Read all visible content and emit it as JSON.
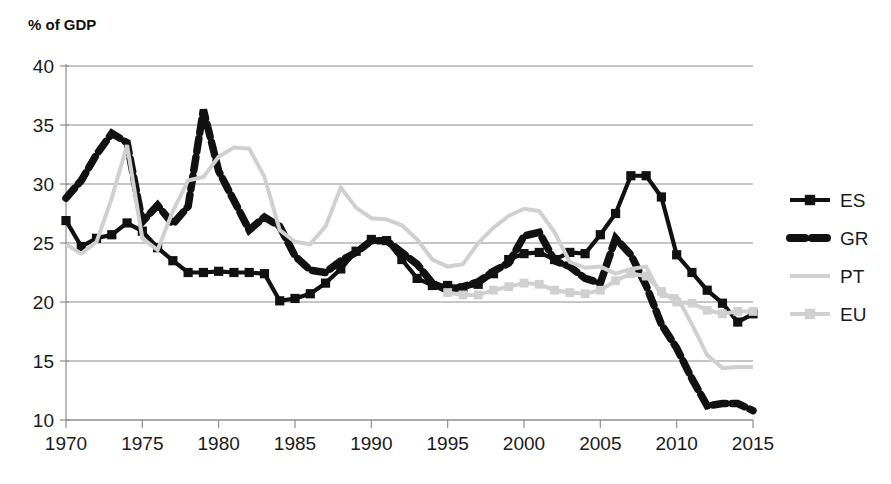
{
  "chart_data": {
    "type": "line",
    "title": "",
    "ylabel": "% of GDP",
    "xlabel": "",
    "ylim": [
      10,
      40
    ],
    "xlim": [
      1970,
      2015
    ],
    "yticks": [
      10,
      15,
      20,
      25,
      30,
      35,
      40
    ],
    "xticks": [
      1970,
      1975,
      1980,
      1985,
      1990,
      1995,
      2000,
      2005,
      2010,
      2015
    ],
    "grid": true,
    "legend_position": "right",
    "series": [
      {
        "name": "ES",
        "color": "#111111",
        "style": "solid",
        "marker": "square",
        "x": [
          1970,
          1971,
          1972,
          1973,
          1974,
          1975,
          1976,
          1977,
          1978,
          1979,
          1980,
          1981,
          1982,
          1983,
          1984,
          1985,
          1986,
          1987,
          1988,
          1989,
          1990,
          1991,
          1992,
          1993,
          1994,
          1995,
          1996,
          1997,
          1998,
          1999,
          2000,
          2001,
          2002,
          2003,
          2004,
          2005,
          2006,
          2007,
          2008,
          2009,
          2010,
          2011,
          2012,
          2013,
          2014,
          2015
        ],
        "values": [
          26.9,
          24.7,
          25.4,
          25.7,
          26.7,
          26.0,
          24.6,
          23.5,
          22.5,
          22.5,
          22.6,
          22.5,
          22.5,
          22.4,
          20.1,
          20.3,
          20.7,
          21.6,
          22.8,
          24.3,
          25.3,
          25.2,
          23.6,
          22.0,
          21.4,
          21.4,
          21.2,
          21.5,
          22.4,
          23.6,
          24.1,
          24.2,
          23.6,
          24.2,
          24.1,
          25.7,
          27.5,
          30.7,
          30.7,
          28.9,
          24.0,
          22.5,
          21.0,
          19.9,
          18.3,
          19.0
        ]
      },
      {
        "name": "GR",
        "color": "#111111",
        "style": "dashed",
        "marker": "none",
        "x": [
          1970,
          1971,
          1972,
          1973,
          1974,
          1975,
          1976,
          1977,
          1978,
          1979,
          1980,
          1981,
          1982,
          1983,
          1984,
          1985,
          1986,
          1987,
          1988,
          1989,
          1990,
          1991,
          1992,
          1993,
          1994,
          1995,
          1996,
          1997,
          1998,
          1999,
          2000,
          2001,
          2002,
          2003,
          2004,
          2005,
          2006,
          2007,
          2008,
          2009,
          2010,
          2011,
          2012,
          2013,
          2014,
          2015
        ],
        "values": [
          28.8,
          30.3,
          32.5,
          34.3,
          33.5,
          26.8,
          28.2,
          26.6,
          28.1,
          36.3,
          31.1,
          28.6,
          26.1,
          27.2,
          26.4,
          23.9,
          22.7,
          22.5,
          23.5,
          24.2,
          25.2,
          25.2,
          24.2,
          23.2,
          21.6,
          21.0,
          21.3,
          21.7,
          22.6,
          23.3,
          25.6,
          25.9,
          23.5,
          23.0,
          22.0,
          21.6,
          25.4,
          24.0,
          21.4,
          18.1,
          16.1,
          13.5,
          11.2,
          11.4,
          11.4,
          10.8
        ]
      },
      {
        "name": "PT",
        "color": "#d0d0d0",
        "style": "solid",
        "marker": "none",
        "x": [
          1970,
          1971,
          1972,
          1973,
          1974,
          1975,
          1976,
          1977,
          1978,
          1979,
          1980,
          1981,
          1982,
          1983,
          1984,
          1985,
          1986,
          1987,
          1988,
          1989,
          1990,
          1991,
          1992,
          1993,
          1994,
          1995,
          1996,
          1997,
          1998,
          1999,
          2000,
          2001,
          2002,
          2003,
          2004,
          2005,
          2006,
          2007,
          2008,
          2009,
          2010,
          2011,
          2012,
          2013,
          2014,
          2015
        ],
        "values": [
          24.9,
          24.1,
          25.1,
          28.8,
          33.3,
          25.4,
          24.4,
          27.7,
          30.3,
          30.6,
          32.3,
          33.1,
          33.0,
          30.6,
          26.1,
          25.1,
          24.9,
          26.4,
          29.7,
          28.0,
          27.1,
          27.0,
          26.5,
          25.3,
          23.6,
          23.0,
          23.2,
          25.0,
          26.3,
          27.3,
          27.9,
          27.7,
          25.9,
          23.4,
          22.9,
          23.0,
          22.4,
          22.8,
          23.0,
          20.5,
          20.5,
          18.1,
          15.5,
          14.4,
          14.5,
          14.5
        ]
      },
      {
        "name": "EU",
        "color": "#d0d0d0",
        "style": "solid",
        "marker": "square",
        "x": [
          1995,
          1996,
          1997,
          1998,
          1999,
          2000,
          2001,
          2002,
          2003,
          2004,
          2005,
          2006,
          2007,
          2008,
          2009,
          2010,
          2011,
          2012,
          2013,
          2014,
          2015
        ],
        "values": [
          20.8,
          20.6,
          20.6,
          21.0,
          21.3,
          21.6,
          21.5,
          21.0,
          20.8,
          20.7,
          21.0,
          21.8,
          22.4,
          22.2,
          20.9,
          20.0,
          19.9,
          19.3,
          19.0,
          19.2,
          19.2
        ]
      }
    ],
    "legend": [
      {
        "label": "ES",
        "color": "#111111",
        "style": "solid",
        "marker": "square"
      },
      {
        "label": "GR",
        "color": "#111111",
        "style": "dashed",
        "marker": "none"
      },
      {
        "label": "PT",
        "color": "#d0d0d0",
        "style": "solid",
        "marker": "none"
      },
      {
        "label": "EU",
        "color": "#d0d0d0",
        "style": "solid",
        "marker": "square"
      }
    ]
  },
  "layout": {
    "plot_left": 66,
    "plot_right": 753,
    "plot_top": 66,
    "plot_bottom": 420,
    "legend_x": 790,
    "legend_y_start": 200,
    "legend_row_gap": 38,
    "ylabel_x": 28,
    "ylabel_y": 30
  }
}
